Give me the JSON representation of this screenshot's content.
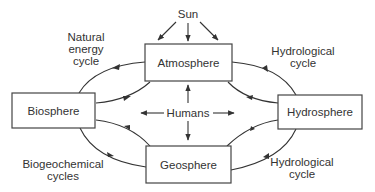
{
  "diagram": {
    "type": "earth-systems-cycle",
    "colors": {
      "stroke": "#333333",
      "text": "#333333",
      "background": "#ffffff"
    },
    "source": {
      "label": "Sun"
    },
    "center": {
      "label": "Humans"
    },
    "nodes": {
      "atmosphere": {
        "label": "Atmosphere"
      },
      "biosphere": {
        "label": "Biosphere"
      },
      "hydrosphere": {
        "label": "Hydrosphere"
      },
      "geosphere": {
        "label": "Geosphere"
      }
    },
    "cycles": {
      "top_left": {
        "lines": [
          "Natural",
          "energy",
          "cycle"
        ]
      },
      "top_right": {
        "lines": [
          "Hydrological",
          "cycle"
        ]
      },
      "bottom_left": {
        "lines": [
          "Biogeochemical",
          "cycles"
        ]
      },
      "bottom_right": {
        "lines": [
          "Hydrological",
          "cycle"
        ]
      }
    },
    "edges": [
      {
        "from": "Sun",
        "to": "Atmosphere",
        "count": 3
      },
      {
        "from": "Atmosphere",
        "to": "Biosphere"
      },
      {
        "from": "Biosphere",
        "to": "Atmosphere"
      },
      {
        "from": "Atmosphere",
        "to": "Hydrosphere"
      },
      {
        "from": "Hydrosphere",
        "to": "Atmosphere"
      },
      {
        "from": "Biosphere",
        "to": "Geosphere"
      },
      {
        "from": "Geosphere",
        "to": "Biosphere"
      },
      {
        "from": "Geosphere",
        "to": "Hydrosphere"
      },
      {
        "from": "Hydrosphere",
        "to": "Geosphere"
      },
      {
        "from": "Humans",
        "to": "Atmosphere"
      },
      {
        "from": "Humans",
        "to": "Biosphere"
      },
      {
        "from": "Humans",
        "to": "Hydrosphere"
      },
      {
        "from": "Humans",
        "to": "Geosphere"
      }
    ]
  }
}
